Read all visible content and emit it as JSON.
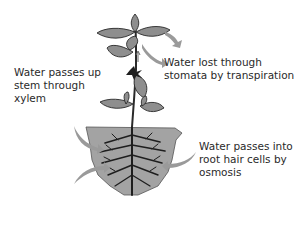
{
  "diagram": {
    "labels": {
      "xylem": [
        "Water passes up",
        "stem through",
        "xylem"
      ],
      "stomata": [
        "Water lost through",
        "stomata by transpiration"
      ],
      "osmosis": [
        "Water passes into",
        "root hair cells by",
        "osmosis"
      ]
    },
    "colors": {
      "leaf": "#8e8e8e",
      "leaf_outline": "#2a2a2a",
      "soil": "#a3a3a3",
      "roots": "#1e1e1e",
      "arrow": "#9a9a9a",
      "text": "#2a2a2a"
    }
  }
}
